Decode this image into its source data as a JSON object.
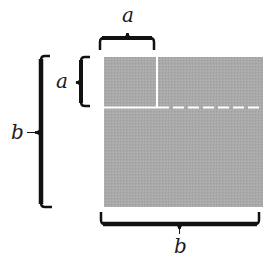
{
  "diagram": {
    "labels": {
      "top_a": "a",
      "left_a": "a",
      "left_b": "b",
      "bottom_b": "b"
    },
    "colors": {
      "fill": "#a9a9a9",
      "divider": "#ffffff",
      "ink": "#111111"
    },
    "regions": [
      {
        "name": "small-square",
        "side": "a"
      },
      {
        "name": "top-right-rectangle"
      },
      {
        "name": "bottom-rectangle"
      }
    ]
  }
}
